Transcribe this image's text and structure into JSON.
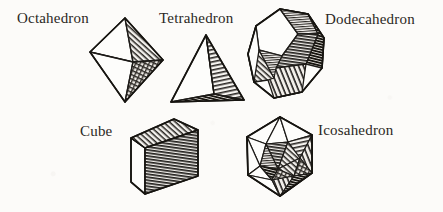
{
  "illustration": {
    "title": "The Five Platonic Solids",
    "background_color": "#fcfbf9",
    "ink_color": "#1d1b18",
    "style": "hand-drawn engraving with hatched shading",
    "width": 443,
    "height": 212
  },
  "labels": {
    "octahedron": "Octahedron",
    "tetrahedron": "Tetrahedron",
    "dodecahedron": "Dodecahedron",
    "cube": "Cube",
    "icosahedron": "Icosahedron"
  },
  "figures": [
    {
      "id": "octahedron",
      "label": "Octahedron",
      "faces": 8,
      "row": 1,
      "column": 1
    },
    {
      "id": "tetrahedron",
      "label": "Tetrahedron",
      "faces": 4,
      "row": 1,
      "column": 2
    },
    {
      "id": "dodecahedron",
      "label": "Dodecahedron",
      "faces": 12,
      "row": 1,
      "column": 3
    },
    {
      "id": "cube",
      "label": "Cube",
      "faces": 6,
      "row": 2,
      "column": 1
    },
    {
      "id": "icosahedron",
      "label": "Icosahedron",
      "faces": 20,
      "row": 2,
      "column": 2
    }
  ]
}
